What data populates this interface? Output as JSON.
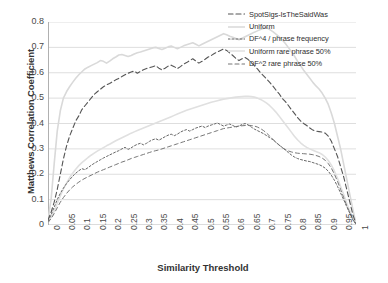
{
  "chart_data": {
    "type": "line",
    "title": "",
    "xlabel": "Similarity Threshold",
    "ylabel": "Matthews Correlation Coefficient",
    "xlim": [
      0,
      1
    ],
    "ylim": [
      0,
      0.8
    ],
    "grid": true,
    "legend_position": "top-right",
    "xticks": [
      "0",
      "0.05",
      "0.1",
      "0.15",
      "0.2",
      "0.25",
      "0.3",
      "0.35",
      "0.4",
      "0.45",
      "0.5",
      "0.55",
      "0.6",
      "0.65",
      "0.7",
      "0.75",
      "0.8",
      "0.85",
      "0.9",
      "0.95",
      "1"
    ],
    "yticks": [
      "0",
      "0.1",
      "0.2",
      "0.3",
      "0.4",
      "0.5",
      "0.6",
      "0.7",
      "0.8"
    ],
    "x": [
      0,
      0.01,
      0.02,
      0.03,
      0.04,
      0.05,
      0.06,
      0.07,
      0.08,
      0.09,
      0.1,
      0.11,
      0.12,
      0.13,
      0.14,
      0.15,
      0.16,
      0.17,
      0.18,
      0.19,
      0.2,
      0.21,
      0.22,
      0.23,
      0.24,
      0.25,
      0.26,
      0.27,
      0.28,
      0.29,
      0.3,
      0.31,
      0.32,
      0.33,
      0.34,
      0.35,
      0.36,
      0.37,
      0.38,
      0.39,
      0.4,
      0.41,
      0.42,
      0.43,
      0.44,
      0.45,
      0.46,
      0.47,
      0.48,
      0.49,
      0.5,
      0.51,
      0.52,
      0.53,
      0.54,
      0.55,
      0.56,
      0.57,
      0.58,
      0.59,
      0.6,
      0.61,
      0.62,
      0.63,
      0.64,
      0.65,
      0.66,
      0.67,
      0.68,
      0.69,
      0.7,
      0.71,
      0.72,
      0.73,
      0.74,
      0.75,
      0.76,
      0.77,
      0.78,
      0.79,
      0.8,
      0.81,
      0.82,
      0.83,
      0.84,
      0.85,
      0.86,
      0.87,
      0.88,
      0.89,
      0.9,
      0.91,
      0.92,
      0.93,
      0.94,
      0.95,
      0.96,
      0.97,
      0.98,
      0.99,
      1
    ],
    "series": [
      {
        "name": "SpotSigs-IsTheSaidWas",
        "style": "dash",
        "color": "#555555",
        "values": [
          0.02,
          0.05,
          0.09,
          0.14,
          0.2,
          0.26,
          0.31,
          0.35,
          0.38,
          0.41,
          0.43,
          0.455,
          0.47,
          0.485,
          0.5,
          0.515,
          0.525,
          0.535,
          0.545,
          0.552,
          0.558,
          0.565,
          0.572,
          0.578,
          0.585,
          0.592,
          0.598,
          0.603,
          0.607,
          0.598,
          0.605,
          0.612,
          0.617,
          0.62,
          0.624,
          0.628,
          0.618,
          0.611,
          0.618,
          0.626,
          0.63,
          0.624,
          0.616,
          0.624,
          0.634,
          0.64,
          0.648,
          0.655,
          0.646,
          0.638,
          0.645,
          0.653,
          0.662,
          0.668,
          0.676,
          0.682,
          0.688,
          0.694,
          0.688,
          0.678,
          0.668,
          0.657,
          0.648,
          0.655,
          0.66,
          0.652,
          0.64,
          0.628,
          0.615,
          0.6,
          0.588,
          0.575,
          0.562,
          0.548,
          0.532,
          0.518,
          0.5,
          0.487,
          0.472,
          0.455,
          0.44,
          0.424,
          0.41,
          0.4,
          0.392,
          0.382,
          0.374,
          0.37,
          0.368,
          0.366,
          0.362,
          0.35,
          0.33,
          0.3,
          0.27,
          0.23,
          0.19,
          0.14,
          0.09,
          0.04,
          0.005
        ]
      },
      {
        "name": "Uniform",
        "style": "solid-light",
        "color": "#d9d9d9",
        "values": [
          0.02,
          0.1,
          0.24,
          0.37,
          0.45,
          0.5,
          0.525,
          0.545,
          0.562,
          0.578,
          0.592,
          0.604,
          0.615,
          0.622,
          0.628,
          0.634,
          0.64,
          0.648,
          0.645,
          0.638,
          0.646,
          0.655,
          0.662,
          0.67,
          0.672,
          0.668,
          0.664,
          0.668,
          0.674,
          0.679,
          0.682,
          0.686,
          0.69,
          0.694,
          0.698,
          0.7,
          0.696,
          0.692,
          0.697,
          0.702,
          0.705,
          0.7,
          0.695,
          0.7,
          0.706,
          0.71,
          0.714,
          0.718,
          0.712,
          0.706,
          0.712,
          0.718,
          0.724,
          0.73,
          0.736,
          0.742,
          0.748,
          0.754,
          0.75,
          0.744,
          0.74,
          0.735,
          0.73,
          0.736,
          0.742,
          0.748,
          0.754,
          0.76,
          0.765,
          0.77,
          0.775,
          0.778,
          0.77,
          0.762,
          0.752,
          0.742,
          0.73,
          0.716,
          0.7,
          0.684,
          0.666,
          0.646,
          0.628,
          0.61,
          0.594,
          0.578,
          0.562,
          0.548,
          0.536,
          0.52,
          0.5,
          0.475,
          0.44,
          0.4,
          0.35,
          0.3,
          0.24,
          0.18,
          0.12,
          0.06,
          0.005
        ]
      },
      {
        "name": "DF^4 / phrase frequency",
        "style": "dot-dash",
        "color": "#666666",
        "values": [
          0.015,
          0.04,
          0.07,
          0.1,
          0.125,
          0.145,
          0.163,
          0.178,
          0.192,
          0.204,
          0.214,
          0.222,
          0.218,
          0.226,
          0.235,
          0.243,
          0.25,
          0.257,
          0.264,
          0.27,
          0.276,
          0.282,
          0.288,
          0.293,
          0.3,
          0.306,
          0.298,
          0.304,
          0.312,
          0.318,
          0.322,
          0.316,
          0.322,
          0.33,
          0.336,
          0.34,
          0.334,
          0.341,
          0.348,
          0.354,
          0.358,
          0.352,
          0.358,
          0.366,
          0.372,
          0.376,
          0.37,
          0.376,
          0.382,
          0.386,
          0.39,
          0.384,
          0.39,
          0.394,
          0.398,
          0.402,
          0.396,
          0.39,
          0.394,
          0.398,
          0.392,
          0.386,
          0.39,
          0.396,
          0.4,
          0.394,
          0.386,
          0.378,
          0.372,
          0.366,
          0.36,
          0.352,
          0.344,
          0.336,
          0.326,
          0.316,
          0.306,
          0.296,
          0.286,
          0.276,
          0.268,
          0.262,
          0.258,
          0.255,
          0.252,
          0.25,
          0.246,
          0.242,
          0.238,
          0.232,
          0.224,
          0.212,
          0.196,
          0.176,
          0.152,
          0.126,
          0.1,
          0.072,
          0.046,
          0.02,
          0.003
        ]
      },
      {
        "name": "Uniform rare phrase 50%",
        "style": "solid-light2",
        "color": "#e0e0e0",
        "values": [
          0.012,
          0.03,
          0.055,
          0.085,
          0.115,
          0.142,
          0.165,
          0.186,
          0.204,
          0.22,
          0.234,
          0.246,
          0.256,
          0.266,
          0.275,
          0.283,
          0.291,
          0.298,
          0.305,
          0.312,
          0.318,
          0.325,
          0.332,
          0.338,
          0.344,
          0.35,
          0.356,
          0.362,
          0.367,
          0.372,
          0.377,
          0.382,
          0.387,
          0.392,
          0.397,
          0.402,
          0.407,
          0.412,
          0.417,
          0.422,
          0.427,
          0.432,
          0.437,
          0.442,
          0.447,
          0.452,
          0.456,
          0.46,
          0.464,
          0.468,
          0.472,
          0.476,
          0.48,
          0.484,
          0.487,
          0.49,
          0.493,
          0.496,
          0.498,
          0.5,
          0.502,
          0.504,
          0.505,
          0.506,
          0.507,
          0.507,
          0.506,
          0.504,
          0.5,
          0.495,
          0.488,
          0.48,
          0.47,
          0.458,
          0.445,
          0.43,
          0.414,
          0.398,
          0.382,
          0.366,
          0.35,
          0.336,
          0.324,
          0.314,
          0.306,
          0.3,
          0.295,
          0.29,
          0.285,
          0.278,
          0.268,
          0.254,
          0.236,
          0.212,
          0.184,
          0.152,
          0.12,
          0.086,
          0.055,
          0.025,
          0.004
        ]
      },
      {
        "name": "DF^2 rare phrase 50%",
        "style": "dash2",
        "color": "#777777",
        "values": [
          0.01,
          0.025,
          0.045,
          0.068,
          0.09,
          0.108,
          0.124,
          0.138,
          0.15,
          0.16,
          0.169,
          0.177,
          0.184,
          0.19,
          0.196,
          0.202,
          0.208,
          0.213,
          0.218,
          0.223,
          0.228,
          0.233,
          0.238,
          0.243,
          0.248,
          0.252,
          0.257,
          0.262,
          0.266,
          0.27,
          0.274,
          0.278,
          0.282,
          0.286,
          0.29,
          0.293,
          0.296,
          0.3,
          0.304,
          0.308,
          0.312,
          0.316,
          0.32,
          0.324,
          0.328,
          0.332,
          0.336,
          0.34,
          0.344,
          0.348,
          0.352,
          0.356,
          0.36,
          0.364,
          0.368,
          0.372,
          0.376,
          0.38,
          0.382,
          0.384,
          0.386,
          0.388,
          0.39,
          0.391,
          0.392,
          0.393,
          0.392,
          0.39,
          0.386,
          0.38,
          0.372,
          0.362,
          0.35,
          0.338,
          0.326,
          0.315,
          0.305,
          0.298,
          0.292,
          0.288,
          0.285,
          0.283,
          0.282,
          0.281,
          0.28,
          0.279,
          0.277,
          0.274,
          0.27,
          0.264,
          0.255,
          0.242,
          0.224,
          0.2,
          0.172,
          0.14,
          0.108,
          0.076,
          0.048,
          0.022,
          0.003
        ]
      }
    ]
  }
}
